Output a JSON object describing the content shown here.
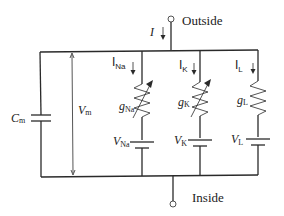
{
  "terminals": {
    "outside": "Outside",
    "inside": "Inside"
  },
  "current": {
    "total": "I",
    "na": {
      "main": "I",
      "sub": "Na"
    },
    "k": {
      "main": "I",
      "sub": "K"
    },
    "l": {
      "main": "I",
      "sub": "L"
    }
  },
  "membrane": {
    "capacitance": {
      "main": "C",
      "sub": "m"
    },
    "voltage": {
      "main": "V",
      "sub": "m"
    }
  },
  "conductances": {
    "na": {
      "main": "g",
      "sub": "Na"
    },
    "k": {
      "main": "g",
      "sub": "K"
    },
    "l": {
      "main": "g",
      "sub": "L"
    }
  },
  "reversal_potentials": {
    "na": {
      "main": "V",
      "sub": "Na"
    },
    "k": {
      "main": "V",
      "sub": "K"
    },
    "l": {
      "main": "V",
      "sub": "L"
    }
  },
  "colors": {
    "line": "#2a2a2a",
    "background": "#ffffff"
  }
}
